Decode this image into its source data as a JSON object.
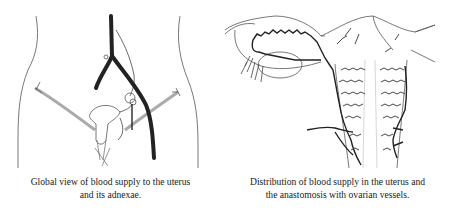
{
  "figures": [
    {
      "id": "left",
      "caption_line1": "Global view of blood supply to the uterus",
      "caption_line2": "and its adnexae."
    },
    {
      "id": "right",
      "caption_line1": "Distribution of blood supply in the uterus and",
      "caption_line2": "the anastomosis with ovarian vessels."
    }
  ],
  "colors": {
    "line": "#3a3a3a",
    "vessel": "#222222",
    "background": "#ffffff"
  }
}
